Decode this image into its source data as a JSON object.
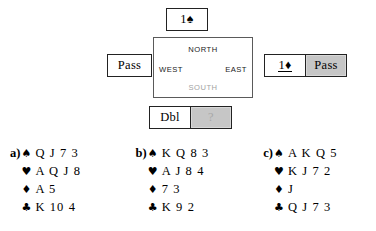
{
  "bidding": {
    "north_bid": {
      "label": "1♠",
      "name": "bid-north",
      "style": "plain"
    },
    "west_bid": {
      "label": "Pass",
      "name": "bid-west",
      "style": "plain"
    },
    "east_bid_1": {
      "label": "1♦",
      "name": "bid-east-first",
      "style": "underlined"
    },
    "east_bid_2": {
      "label": "Pass",
      "name": "bid-east-second",
      "style": "gray"
    },
    "south_bid_1": {
      "label": "Dbl",
      "name": "bid-south-first",
      "style": "plain"
    },
    "south_bid_2": {
      "label": "?",
      "name": "bid-south-pending",
      "style": "gray-faded"
    }
  },
  "compass": {
    "north": "NORTH",
    "west": "WEST",
    "east": "EAST",
    "south": "SOUTH"
  },
  "suits": {
    "spade": "♠",
    "heart": "♥",
    "diamond": "♦",
    "club": "♣"
  },
  "hands": [
    {
      "letter": "a)",
      "spades": "Q J 7 3",
      "hearts": "A Q J 8",
      "diamonds": "A 5",
      "clubs": "K 10 4"
    },
    {
      "letter": "b)",
      "spades": "K Q 8 3",
      "hearts": "A J 8 4",
      "diamonds": "7 3",
      "clubs": "K 9 2"
    },
    {
      "letter": "c)",
      "spades": "A K Q 5",
      "hearts": "K J 7 2",
      "diamonds": "J",
      "clubs": "Q J 7 3"
    }
  ],
  "colors": {
    "page_background": "#ffffff",
    "text": "#000000",
    "box_border": "#222222",
    "table_border": "#5a5a5a",
    "gray_fill": "#c6c6c6",
    "faded_text": "#a8a8a8",
    "south_label": "#a3a3a3"
  }
}
